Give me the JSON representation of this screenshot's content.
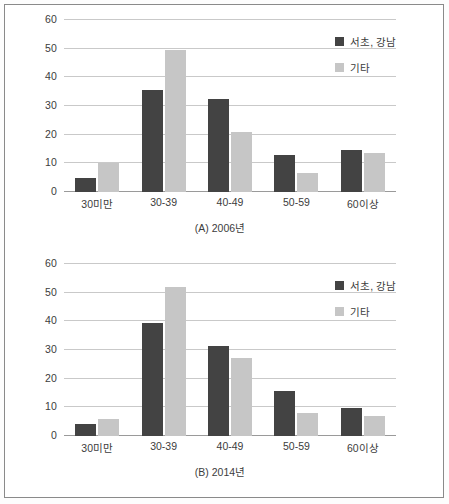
{
  "figure": {
    "background_color": "#ffffff",
    "border_color": "#8a8a8a"
  },
  "series_colors": {
    "seocho_gangnam": "#434343",
    "other": "#c6c6c6"
  },
  "legend": {
    "items": [
      {
        "label": "서초, 강남",
        "color": "#434343",
        "swatch": "square-swatch-icon"
      },
      {
        "label": "기타",
        "color": "#c6c6c6",
        "swatch": "square-swatch-icon"
      }
    ]
  },
  "axis": {
    "yticks": [
      "0",
      "10",
      "20",
      "30",
      "40",
      "50",
      "60"
    ],
    "xticks": [
      "30미만",
      "30-39",
      "40-49",
      "50-59",
      "60이상"
    ]
  },
  "chart_data": [
    {
      "type": "bar",
      "id": "chart-a",
      "title": "(A) 2006년",
      "categories": [
        "30미만",
        "30-39",
        "40-49",
        "50-59",
        "60이상"
      ],
      "series": [
        {
          "name": "서초, 강남",
          "color": "#434343",
          "values": [
            5,
            35.5,
            32.5,
            13,
            14.5
          ]
        },
        {
          "name": "기타",
          "color": "#c6c6c6",
          "values": [
            10,
            49.5,
            21,
            6.8,
            13.5
          ]
        }
      ],
      "xlabel": "",
      "ylabel": "",
      "ylim": [
        0,
        60
      ],
      "ytick_step": 10,
      "grid": true,
      "legend_position": "top-right"
    },
    {
      "type": "bar",
      "id": "chart-b",
      "title": "(B) 2014년",
      "categories": [
        "30미만",
        "30-39",
        "40-49",
        "50-59",
        "60이상"
      ],
      "series": [
        {
          "name": "서초, 강남",
          "color": "#434343",
          "values": [
            4.3,
            39.3,
            31.3,
            15.7,
            9.8
          ]
        },
        {
          "name": "기타",
          "color": "#c6c6c6",
          "values": [
            6,
            52,
            27.3,
            8.2,
            7
          ]
        }
      ],
      "xlabel": "",
      "ylabel": "",
      "ylim": [
        0,
        60
      ],
      "ytick_step": 10,
      "grid": true,
      "legend_position": "top-right"
    }
  ]
}
